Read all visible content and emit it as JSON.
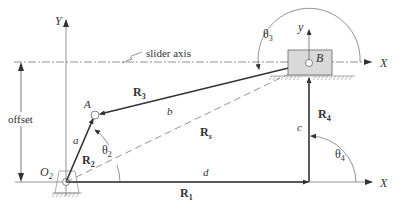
{
  "labels": {
    "Y_axis": "Y",
    "X_axis_top": "X",
    "X_axis_bottom": "X",
    "local_y": "y",
    "slider_axis": "slider axis",
    "offset": "offset",
    "point_A": "A",
    "point_B": "B",
    "origin_O": "O",
    "origin_sub": "2",
    "link_a": "a",
    "link_b": "b",
    "link_c": "c",
    "link_d": "d",
    "R1": "R",
    "R1_sub": "1",
    "R2": "R",
    "R2_sub": "2",
    "R3": "R",
    "R3_sub": "3",
    "R4": "R",
    "R4_sub": "4",
    "Rs": "R",
    "Rs_sub": "s",
    "theta2": "θ",
    "theta2_sub": "2",
    "theta3": "θ",
    "theta3_sub": "3",
    "theta4": "θ",
    "theta4_sub": "4"
  },
  "colors": {
    "line": "#333333",
    "thin": "#666666",
    "slider_fill": "#d9d9d9"
  }
}
